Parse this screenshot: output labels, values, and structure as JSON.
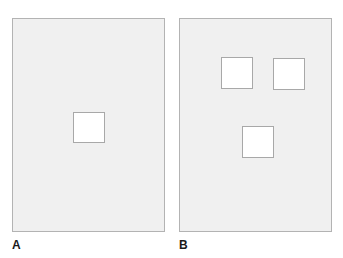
{
  "figure": {
    "canvas": {
      "width": 343,
      "height": 258,
      "background_color": "#ffffff"
    },
    "style": {
      "panel_fill_color": "#f0f0f0",
      "panel_border_color": "#b3b3b3",
      "square_fill_color": "#ffffff",
      "square_border_color": "#a8a8a8",
      "label_text_color": "#1a1a1a"
    },
    "panels": [
      {
        "id": "panel-a",
        "label": "A",
        "x": 12,
        "y": 18,
        "width": 153,
        "height": 214,
        "squares": [
          {
            "name": "center-square",
            "x": 60,
            "y": 93,
            "width": 32,
            "height": 31
          }
        ]
      },
      {
        "id": "panel-b",
        "label": "B",
        "x": 179,
        "y": 18,
        "width": 153,
        "height": 214,
        "squares": [
          {
            "name": "top-left-square",
            "x": 41,
            "y": 38,
            "width": 32,
            "height": 32
          },
          {
            "name": "top-right-square",
            "x": 93,
            "y": 39,
            "width": 32,
            "height": 32
          },
          {
            "name": "bottom-center-square",
            "x": 62,
            "y": 107,
            "width": 32,
            "height": 32
          }
        ]
      }
    ]
  }
}
